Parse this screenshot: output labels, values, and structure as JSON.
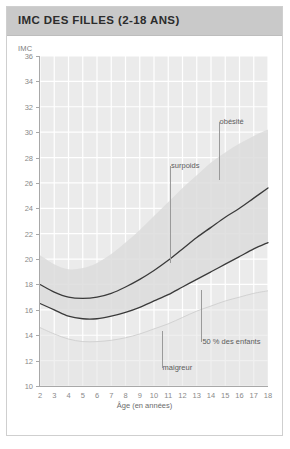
{
  "header": {
    "title": "IMC DES FILLES (2-18 ANS)"
  },
  "colors": {
    "header_band": "#c9c9c9",
    "card_background": "#ffffff",
    "plot_background": "#ebebeb",
    "gridline": "#ffffff",
    "curve": "#3a3a3a",
    "band_fill": "#dcdcdc",
    "axis": "#a8a8a8",
    "tick_text": "#8a8a8a",
    "annotation_text": "#5c5c5c"
  },
  "chart_data": {
    "type": "line",
    "title": "IMC DES FILLES (2-18 ANS)",
    "subtitle": "",
    "xlabel": "Âge (en années)",
    "ylabel": "IMC",
    "xlim": [
      2,
      18
    ],
    "ylim": [
      10,
      36
    ],
    "grid": true,
    "legend_position": "inline-annotations",
    "xticks": [
      2,
      3,
      4,
      5,
      6,
      7,
      8,
      9,
      10,
      11,
      12,
      13,
      14,
      15,
      16,
      17,
      18
    ],
    "yticks": [
      10,
      12,
      14,
      16,
      18,
      20,
      22,
      24,
      26,
      28,
      30,
      32,
      34,
      36
    ],
    "x": [
      2,
      3,
      4,
      5,
      6,
      7,
      8,
      9,
      10,
      11,
      12,
      13,
      14,
      15,
      16,
      17,
      18
    ],
    "series": [
      {
        "name": "surpoids",
        "role": "overweight-threshold-curve",
        "style": "solid-dark-line",
        "values": [
          18.0,
          17.4,
          17.0,
          16.9,
          17.0,
          17.3,
          17.8,
          18.4,
          19.1,
          19.9,
          20.8,
          21.7,
          22.5,
          23.3,
          24.0,
          24.8,
          25.6
        ]
      },
      {
        "name": "50 % des enfants",
        "role": "median-curve",
        "style": "solid-dark-line",
        "values": [
          16.5,
          16.0,
          15.5,
          15.3,
          15.3,
          15.5,
          15.8,
          16.2,
          16.7,
          17.2,
          17.8,
          18.4,
          19.0,
          19.6,
          20.2,
          20.8,
          21.3
        ]
      }
    ],
    "bands": [
      {
        "name": "obésité",
        "role": "obesity-band-upper-edge",
        "fill": "#dcdcdc",
        "values": [
          20.3,
          19.6,
          19.2,
          19.3,
          19.7,
          20.4,
          21.3,
          22.3,
          23.4,
          24.5,
          25.6,
          26.6,
          27.6,
          28.4,
          29.1,
          29.7,
          30.2
        ]
      },
      {
        "name": "maigreur",
        "role": "thinness-band-lower-edge",
        "fill": "#e3e3e3",
        "values": [
          14.6,
          14.1,
          13.7,
          13.5,
          13.5,
          13.6,
          13.8,
          14.1,
          14.5,
          14.9,
          15.4,
          15.9,
          16.3,
          16.7,
          17.0,
          17.3,
          17.5
        ]
      }
    ],
    "annotations": [
      {
        "label": "obésité",
        "x": 14.6,
        "y": 30.8,
        "leader_to_y": 26.2
      },
      {
        "label": "surpoids",
        "x": 11.2,
        "y": 27.3,
        "leader_to_y": 19.7
      },
      {
        "label": "50 % des enfants",
        "x": 13.4,
        "y": 13.5,
        "leader_to_y": 17.6
      },
      {
        "label": "maigreur",
        "x": 10.6,
        "y": 11.4,
        "leader_to_y": 14.3
      }
    ]
  }
}
